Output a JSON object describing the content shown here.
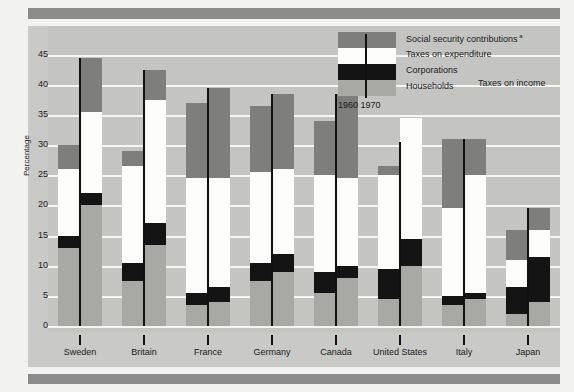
{
  "chart_data": {
    "type": "bar",
    "title": "",
    "subtype": "stacked-bar-paired",
    "xlabel": "",
    "ylabel": "Percentage",
    "ylim": [
      0,
      47
    ],
    "yticks": [
      0,
      5,
      10,
      15,
      20,
      25,
      30,
      35,
      40,
      45
    ],
    "grid": true,
    "categories": [
      "Sweden",
      "Britain",
      "France",
      "Germany",
      "Canada",
      "United States",
      "Italy",
      "Japan"
    ],
    "year_labels": [
      "1960",
      "1970"
    ],
    "stack_order": [
      "Households",
      "Corporations",
      "Taxes on expenditure",
      "Social security contributions"
    ],
    "legend": [
      {
        "key": "social-security",
        "label": "Social security contributions",
        "superscript": "a",
        "color": "#7e7e7c"
      },
      {
        "key": "expenditure",
        "label": "Taxes on expenditure",
        "superscript": "",
        "color": "#fdfdfb"
      },
      {
        "key": "corporations",
        "label": "Corporations",
        "superscript": "",
        "color": "#141414"
      },
      {
        "key": "households",
        "label": "Households",
        "superscript": "",
        "color": "#a8a8a4"
      }
    ],
    "legend_group_label": "Taxes on income",
    "series": [
      {
        "name": "Households",
        "color": "#a8a8a4",
        "values_1960": [
          13.0,
          7.5,
          3.5,
          7.5,
          5.5,
          4.5,
          3.5,
          2.0
        ],
        "values_1970": [
          20.0,
          13.5,
          4.0,
          9.0,
          8.0,
          10.0,
          4.5,
          4.0
        ]
      },
      {
        "name": "Corporations",
        "color": "#141414",
        "values_1960": [
          15.0,
          10.5,
          5.5,
          10.5,
          9.0,
          9.5,
          5.0,
          6.5
        ],
        "values_1970": [
          22.0,
          17.0,
          6.5,
          12.0,
          10.0,
          14.5,
          5.5,
          11.5
        ]
      },
      {
        "name": "Taxes on expenditure",
        "color": "#fdfdfb",
        "values_1960": [
          26.0,
          26.5,
          24.5,
          25.5,
          25.0,
          25.0,
          19.5,
          11.0
        ],
        "values_1970": [
          35.5,
          37.5,
          24.5,
          26.0,
          24.5,
          34.5,
          25.0,
          16.0
        ]
      },
      {
        "name": "Social security contributions",
        "color": "#7e7e7c",
        "values_1960": [
          30.0,
          29.0,
          37.0,
          36.5,
          34.0,
          26.5,
          31.0,
          16.0
        ],
        "values_1970": [
          44.5,
          42.5,
          39.5,
          38.5,
          38.5,
          30.5,
          31.0,
          19.5
        ]
      }
    ]
  },
  "ylabel": "Percentage"
}
